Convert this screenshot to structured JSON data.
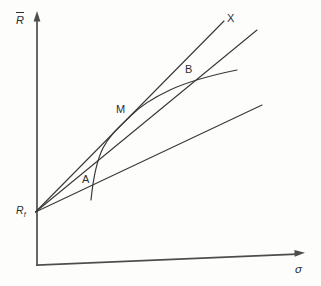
{
  "figure": {
    "background": "#fdfdfc",
    "ink": "#383838",
    "axis_color": "#4d4d4d",
    "label_color": "#2e2e2e"
  },
  "labels": {
    "y_axis": {
      "text": "R",
      "overbar": true
    },
    "origin": {
      "text": "R",
      "sub": "f"
    },
    "x_axis": {
      "text": "σ"
    },
    "point_a": {
      "text": "A"
    },
    "point_m": {
      "text": "M"
    },
    "point_b": {
      "text": "B"
    },
    "point_x": {
      "text": "X"
    }
  },
  "geometry": {
    "axes": [
      {
        "name": "y-axis",
        "x1": 37,
        "y1": 265,
        "x2": 37,
        "y2": 20,
        "width": 1.7,
        "arrow": "37,11 33.6,21.5 40.4,21.5"
      },
      {
        "name": "x-axis",
        "x1": 37,
        "y1": 265,
        "x2": 296,
        "y2": 254.2,
        "width": 1.7,
        "arrow": "305,252.8 294.7,256.7 294.4,249.9"
      }
    ],
    "lines": [
      {
        "name": "capital-market-line",
        "x1": 35.5,
        "y1": 212,
        "x2": 224,
        "y2": 21,
        "width": 1.1
      },
      {
        "name": "rf-b-line",
        "x1": 35.5,
        "y1": 212,
        "x2": 257,
        "y2": 30,
        "width": 1.1
      },
      {
        "name": "rf-a-line",
        "x1": 35.5,
        "y1": 212,
        "x2": 262,
        "y2": 105,
        "width": 1.1
      }
    ],
    "curve": {
      "name": "efficient-frontier-curve",
      "path": "M 91,200 C 93,180 96,162 103,148 C 110,134 121,125.5 131,115.5 C 140,106.5 155,97 170,90 C 185,83 205,76.5 237,70",
      "width": 1.2
    }
  }
}
